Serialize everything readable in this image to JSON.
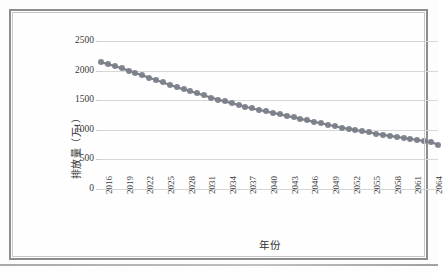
{
  "figure": {
    "background_color": "#ffffff",
    "border_color": "#8d8d8d"
  },
  "chart_data": {
    "type": "line",
    "title": "",
    "xlabel": "年份",
    "ylabel": "排放量（万t）",
    "series_name": "排放量",
    "marker_color": "#7b808a",
    "line_color": "#7b808a",
    "grid": true,
    "legend": "none",
    "ylim": [
      0,
      2500
    ],
    "yticks": [
      0,
      500,
      1000,
      1500,
      2000,
      2500
    ],
    "ytick_labels": [
      "0",
      "500",
      "1000",
      "1500",
      "2000",
      "2500"
    ],
    "xlim": [
      2016,
      2065
    ],
    "xtick_labels": [
      "2016",
      "2019",
      "2022",
      "2025",
      "2028",
      "2031",
      "2034",
      "2037",
      "2040",
      "2043",
      "2046",
      "2049",
      "2052",
      "2055",
      "2058",
      "2061",
      "2064"
    ],
    "x": [
      2016,
      2017,
      2018,
      2019,
      2020,
      2021,
      2022,
      2023,
      2024,
      2025,
      2026,
      2027,
      2028,
      2029,
      2030,
      2031,
      2032,
      2033,
      2034,
      2035,
      2036,
      2037,
      2038,
      2039,
      2040,
      2041,
      2042,
      2043,
      2044,
      2045,
      2046,
      2047,
      2048,
      2049,
      2050,
      2051,
      2052,
      2053,
      2054,
      2055,
      2056,
      2057,
      2058,
      2059,
      2060,
      2061,
      2062,
      2063,
      2064,
      2065
    ],
    "values": [
      2140,
      2110,
      2075,
      2040,
      2000,
      1960,
      1920,
      1880,
      1840,
      1800,
      1760,
      1720,
      1685,
      1650,
      1615,
      1580,
      1545,
      1510,
      1480,
      1450,
      1420,
      1390,
      1360,
      1335,
      1310,
      1285,
      1260,
      1235,
      1210,
      1185,
      1160,
      1135,
      1110,
      1085,
      1060,
      1035,
      1015,
      995,
      975,
      955,
      935,
      915,
      898,
      880,
      862,
      845,
      828,
      810,
      790,
      750
    ]
  }
}
